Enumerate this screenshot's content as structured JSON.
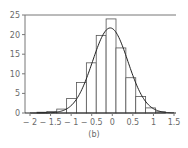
{
  "chart_data": {
    "type": "bar",
    "subtype": "histogram_with_density_curve",
    "title": "",
    "caption": "(b)",
    "xlabel": "",
    "ylabel": "",
    "xlim": [
      -2.1,
      1.5
    ],
    "ylim": [
      0,
      25
    ],
    "x_ticks": [
      -2,
      -1.5,
      -1,
      -0.5,
      0,
      0.5,
      1,
      1.5
    ],
    "x_tick_labels": [
      "− 2",
      "− 1.5",
      "− 1",
      "− 0.5",
      "0",
      "0.5",
      "1",
      "1.5"
    ],
    "y_ticks": [
      0,
      5,
      10,
      15,
      20,
      25
    ],
    "y_tick_labels": [
      "0",
      "5",
      "10",
      "15",
      "20",
      "25"
    ],
    "grid": false,
    "legend": null,
    "bins": [
      {
        "left": -1.83,
        "right": -1.59,
        "value": 0.2
      },
      {
        "left": -1.59,
        "right": -1.35,
        "value": 0.4
      },
      {
        "left": -1.35,
        "right": -1.11,
        "value": 1.0
      },
      {
        "left": -1.11,
        "right": -0.87,
        "value": 3.7
      },
      {
        "left": -0.87,
        "right": -0.63,
        "value": 7.8
      },
      {
        "left": -0.63,
        "right": -0.39,
        "value": 12.8
      },
      {
        "left": -0.39,
        "right": -0.15,
        "value": 19.8
      },
      {
        "left": -0.15,
        "right": 0.09,
        "value": 24.0
      },
      {
        "left": 0.09,
        "right": 0.33,
        "value": 16.6
      },
      {
        "left": 0.33,
        "right": 0.57,
        "value": 9.0
      },
      {
        "left": 0.57,
        "right": 0.81,
        "value": 4.2
      },
      {
        "left": 0.81,
        "right": 1.05,
        "value": 1.3
      },
      {
        "left": 1.05,
        "right": 1.29,
        "value": 0.3
      }
    ],
    "curve": {
      "type": "normal_density_fit",
      "mean": -0.05,
      "sd": 0.43,
      "peak": 21.7
    }
  }
}
